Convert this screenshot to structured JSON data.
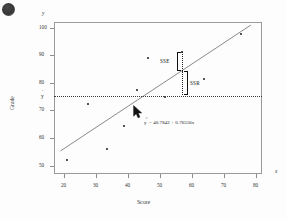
{
  "chart_data": {
    "type": "scatter",
    "title": "",
    "xlabel": "Score",
    "ylabel": "Grade",
    "axis_x_symbol": "x",
    "axis_y_symbol": "y",
    "xlim": [
      17,
      82
    ],
    "ylim": [
      47,
      102
    ],
    "xticks": [
      20,
      30,
      40,
      50,
      60,
      70,
      80
    ],
    "yticks": [
      50,
      60,
      70,
      80,
      90,
      100
    ],
    "grid": false,
    "legend": "none",
    "points": [
      {
        "x": 21.0,
        "y": 52.0
      },
      {
        "x": 27.5,
        "y": 72.5
      },
      {
        "x": 33.5,
        "y": 56.0
      },
      {
        "x": 38.8,
        "y": 64.5
      },
      {
        "x": 43.0,
        "y": 77.5
      },
      {
        "x": 46.5,
        "y": 89.0
      },
      {
        "x": 51.8,
        "y": 75.0
      },
      {
        "x": 57.0,
        "y": 91.3
      },
      {
        "x": 63.8,
        "y": 81.5
      },
      {
        "x": 75.3,
        "y": 97.5
      }
    ],
    "regression": {
      "equation_text": "= 40.7842 + 0.76556x",
      "equation_lhs": "y",
      "hat": "^",
      "intercept": 40.7842,
      "slope": 0.76556,
      "x_start": 19.0,
      "x_end": 78.5
    },
    "mean_line": {
      "label": "y",
      "hat": "¯",
      "value": 75.7,
      "style": "dotted"
    },
    "annotations": [
      {
        "name": "SSE",
        "label": "SSE",
        "at_x": 57.0,
        "y_top": 91.3,
        "y_bottom": 84.4
      },
      {
        "name": "SSR",
        "label": "SSR",
        "at_x": 57.0,
        "y_top": 84.4,
        "y_bottom": 75.7
      }
    ]
  },
  "cursor": {
    "name": "mouse-pointer",
    "x": 133,
    "y": 105
  }
}
